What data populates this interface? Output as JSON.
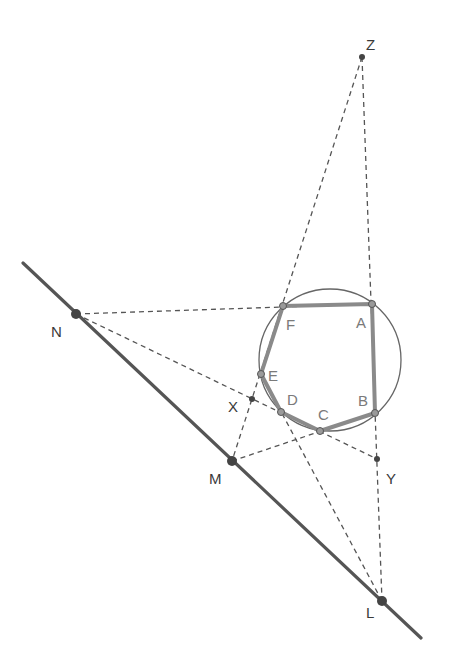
{
  "diagram": {
    "title": "",
    "colors": {
      "solid_line": "#555555",
      "dashed_line": "#555555",
      "hexagon": "#8a8a8a",
      "circle": "#666666",
      "point": "#444444",
      "vertex_fill": "#9a9a9a",
      "label": "#3a3a3a",
      "vertex_label": "#7a7a7a"
    },
    "points": {
      "Z": {
        "label": "Z",
        "x": 362,
        "y": 57
      },
      "N": {
        "label": "N",
        "x": 76,
        "y": 314
      },
      "M": {
        "label": "M",
        "x": 232,
        "y": 461
      },
      "L": {
        "label": "L",
        "x": 382,
        "y": 601
      },
      "X": {
        "label": "X",
        "x": 252,
        "y": 399
      },
      "Y": {
        "label": "Y",
        "x": 377,
        "y": 459
      }
    },
    "hexagon_vertices": {
      "A": {
        "label": "A",
        "x": 372,
        "y": 304
      },
      "B": {
        "label": "B",
        "x": 375,
        "y": 413
      },
      "C": {
        "label": "C",
        "x": 320,
        "y": 431
      },
      "D": {
        "label": "D",
        "x": 281,
        "y": 412
      },
      "E": {
        "label": "E",
        "x": 261,
        "y": 374
      },
      "F": {
        "label": "F",
        "x": 283,
        "y": 306
      }
    },
    "circle": {
      "cx": 330,
      "cy": 360,
      "r": 71
    },
    "solid_line": {
      "from": "line start",
      "to": "line end",
      "through": [
        "N",
        "M",
        "L"
      ]
    },
    "dashed_lines": [
      "Z-A-B-Y-L",
      "Z-F-E-X-M",
      "N-F-A",
      "N-X-D-C-Y",
      "M-C-B",
      "E-D-L"
    ]
  }
}
